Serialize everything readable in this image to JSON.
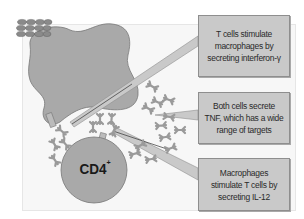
{
  "diagram": {
    "type": "cell interaction illustration",
    "cells": {
      "macrophage": {
        "label": "",
        "color": "#a9a9a9"
      },
      "t_cell": {
        "label": "CD4",
        "superscript": "+",
        "color": "#a9a9a9"
      }
    },
    "callouts": [
      {
        "id": "ifn-gamma",
        "text": "T cells stimulate macrophages by secreting interferon-γ"
      },
      {
        "id": "tnf",
        "text": "Both cells secrete TNF, which has a wide range of targets"
      },
      {
        "id": "il-12",
        "text": "Macrophages stimulate T cells by secreting IL-12"
      }
    ],
    "icon": {
      "name": "cell-layer-icon"
    },
    "colors": {
      "callout_fill": "#c9c9c9",
      "callout_border": "#8e8e8e",
      "cell_fill": "#a9a9a9",
      "panel_bg": "#f7f7f7"
    }
  }
}
